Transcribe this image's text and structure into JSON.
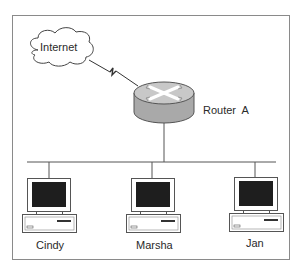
{
  "diagram": {
    "type": "network-topology",
    "cloud": {
      "label": "Internet"
    },
    "router": {
      "label": "Router  A"
    },
    "link_internet_router": "wan-serial-link",
    "computers": [
      {
        "label": "Cindy"
      },
      {
        "label": "Marsha"
      },
      {
        "label": "Jan"
      }
    ],
    "colors": {
      "frame": "#8a8a8a",
      "line": "#555555",
      "router_top": "#c8c8c8",
      "router_side": "#a9a9a9",
      "screen": "#1e1e1e"
    }
  }
}
